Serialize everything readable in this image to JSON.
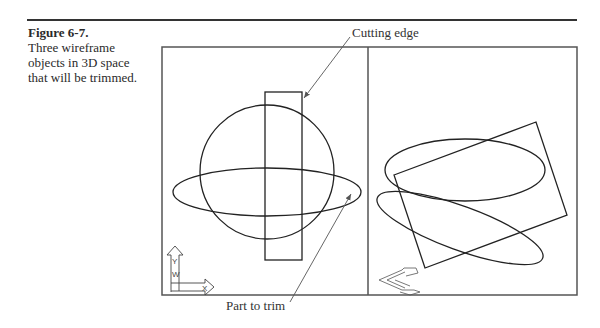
{
  "caption": {
    "figure_number": "Figure 6-7.",
    "text": "Three wireframe objects in 3D space that will be trimmed."
  },
  "callouts": {
    "cutting_edge": "Cutting edge",
    "part_to_trim": "Part to trim"
  },
  "ucs_icon": {
    "y_label": "Y",
    "w_label": "W",
    "x_label": "X"
  },
  "colors": {
    "line": "#222222",
    "frame": "#555555",
    "leader": "#555555"
  }
}
